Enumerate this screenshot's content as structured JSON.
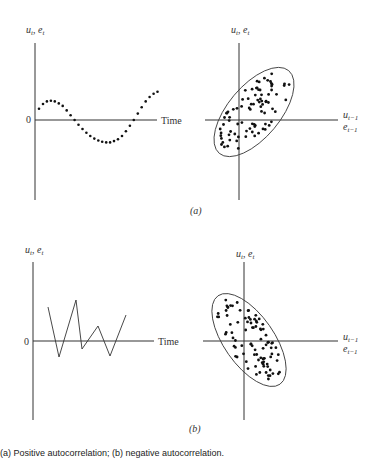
{
  "figure": {
    "caption": "(a) Positive autocorrelation; (b) negative autocorrelation.",
    "panel_labels": [
      "(a)",
      "(b)"
    ],
    "time_label": "Time",
    "zero_label": "0",
    "y_label_time": "u_t, e_t",
    "y_label_scatter": "u_t, e_t",
    "x_label_scatter_top": "u_t−1",
    "x_label_scatter_bottom": "e_t−1"
  },
  "chart_data": [
    {
      "panel": "a-left",
      "type": "scatter",
      "title": "Positive autocorrelation over time",
      "xlabel": "Time",
      "ylabel": "u_t, e_t",
      "description": "Dotted smooth sinusoidal pattern: starts slightly above 0, rises, crosses below 0, reaches a trough, then rises above 0 again",
      "x": [
        1,
        2,
        3,
        4,
        5,
        6,
        7,
        8,
        9,
        10,
        11,
        12,
        13,
        14,
        15,
        16,
        17,
        18,
        19,
        20,
        21,
        22,
        23,
        24,
        25,
        26,
        27,
        28,
        29,
        30,
        31
      ],
      "y": [
        0.35,
        0.5,
        0.58,
        0.6,
        0.58,
        0.52,
        0.44,
        0.3,
        0.15,
        0.0,
        -0.15,
        -0.28,
        -0.4,
        -0.5,
        -0.58,
        -0.64,
        -0.68,
        -0.7,
        -0.7,
        -0.66,
        -0.6,
        -0.5,
        -0.35,
        -0.18,
        0.0,
        0.2,
        0.4,
        0.58,
        0.72,
        0.82,
        0.88
      ]
    },
    {
      "panel": "a-right",
      "type": "scatter",
      "title": "u_t vs u_t−1 (positive correlation)",
      "xlabel": "u_t−1 / e_t−1",
      "ylabel": "u_t, e_t",
      "description": "Points cluster inside an ellipse tilted upward (positive slope) through origin"
    },
    {
      "panel": "b-left",
      "type": "line",
      "title": "Negative autocorrelation over time",
      "xlabel": "Time",
      "ylabel": "u_t, e_t",
      "x": [
        1,
        2,
        3,
        4,
        5,
        6,
        7,
        8
      ],
      "y": [
        0.78,
        -0.5,
        1.0,
        -0.15,
        0.35,
        -0.5,
        0.6,
        0.6
      ],
      "description": "Zig-zag line alternating above and below 0"
    },
    {
      "panel": "b-right",
      "type": "scatter",
      "title": "u_t vs u_t−1 (negative correlation)",
      "xlabel": "u_t−1 / e_t−1",
      "ylabel": "u_t, e_t",
      "description": "Points cluster inside an ellipse tilted downward (negative slope) through origin"
    }
  ]
}
